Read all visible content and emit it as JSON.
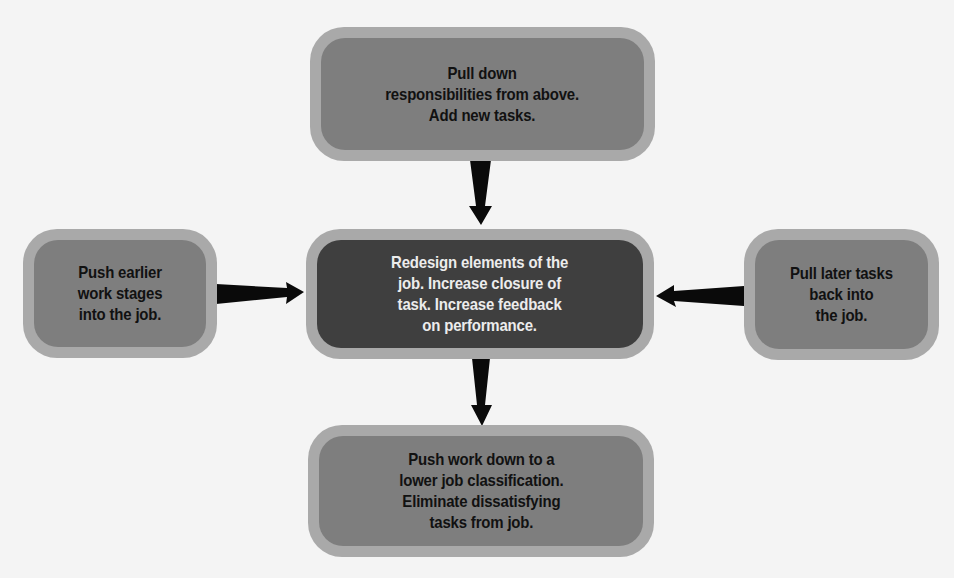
{
  "diagram": {
    "type": "job-redesign-flow",
    "colors": {
      "background": "#f4f4f4",
      "outer_ring": "#a9a9a9",
      "node_fill": "#7e7e7e",
      "center_fill": "#3f3f3f",
      "node_text": "#111111",
      "center_text": "#ececec",
      "arrow": "#0a0a0a"
    },
    "nodes": {
      "top": {
        "text": "Pull down\nresponsibilities from above.\nAdd new tasks."
      },
      "left": {
        "text": "Push earlier\nwork stages\ninto the job."
      },
      "center": {
        "text": "Redesign elements of the\njob.  Increase closure of\ntask.  Increase feedback\non performance."
      },
      "right": {
        "text": "Pull later tasks\nback into\nthe job."
      },
      "bottom": {
        "text": "Push work down to a\nlower job classification.\nEliminate dissatisfying\ntasks from job."
      }
    },
    "arrows": [
      {
        "from": "top",
        "to": "center",
        "direction": "down"
      },
      {
        "from": "left",
        "to": "center",
        "direction": "right"
      },
      {
        "from": "right",
        "to": "center",
        "direction": "left"
      },
      {
        "from": "center",
        "to": "bottom",
        "direction": "down"
      }
    ]
  }
}
